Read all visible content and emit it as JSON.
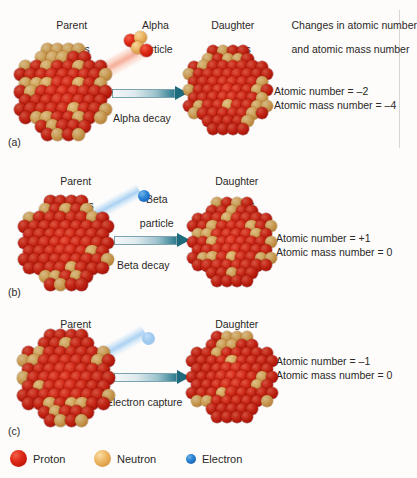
{
  "figure": {
    "legend": {
      "items": [
        {
          "name": "Proton",
          "color": "#d81f16",
          "icon": "proton-sphere-icon"
        },
        {
          "name": "Neutron",
          "color": "#e8a94e",
          "icon": "neutron-sphere-icon"
        },
        {
          "name": "Electron",
          "color": "#1d6fc0",
          "icon": "electron-sphere-icon"
        }
      ]
    },
    "column_header": {
      "changes_title_line1": "Changes in atomic number",
      "changes_title_line2": "and atomic mass number"
    },
    "panels": [
      {
        "tag": "(a)",
        "process": "Alpha decay",
        "parent_label_line1": "Parent",
        "parent_label_line2": "nucleus",
        "emission_label_line1": "Alpha",
        "emission_label_line2": "particle",
        "daughter_label_line1": "Daughter",
        "daughter_label_line2": "nucleus",
        "atomic_number_change": "Atomic number = –2",
        "atomic_mass_change": "Atomic mass number = –4"
      },
      {
        "tag": "(b)",
        "process": "Beta decay",
        "parent_label_line1": "Parent",
        "parent_label_line2": "nucleus",
        "emission_label_line1": "Beta",
        "emission_label_line2": "particle",
        "daughter_label_line1": "Daughter",
        "daughter_label_line2": "nucleus",
        "atomic_number_change": "Atomic number = +1",
        "atomic_mass_change": "Atomic mass number = 0"
      },
      {
        "tag": "(c)",
        "process": "Electron capture",
        "parent_label_line1": "Parent",
        "parent_label_line2": "nucleus",
        "emission_label_line1": "",
        "emission_label_line2": "",
        "daughter_label_line1": "Daughter",
        "daughter_label_line2": "nucleus",
        "atomic_number_change": "Atomic number = –1",
        "atomic_mass_change": "Atomic mass number = 0"
      }
    ]
  },
  "chart_data": {
    "type": "table",
    "title": "Changes in atomic number and atomic mass number",
    "categories": [
      "Alpha decay",
      "Beta decay",
      "Electron capture"
    ],
    "series": [
      {
        "name": "Change in atomic number",
        "values": [
          -2,
          1,
          -1
        ]
      },
      {
        "name": "Change in atomic mass number",
        "values": [
          -4,
          0,
          0
        ]
      }
    ],
    "annotations": [
      "Alpha decay emits an alpha particle (2 protons + 2 neutrons)",
      "Beta decay emits a beta particle (electron)",
      "Electron capture absorbs an electron into the nucleus"
    ],
    "grid": false,
    "legend_position": "bottom"
  }
}
